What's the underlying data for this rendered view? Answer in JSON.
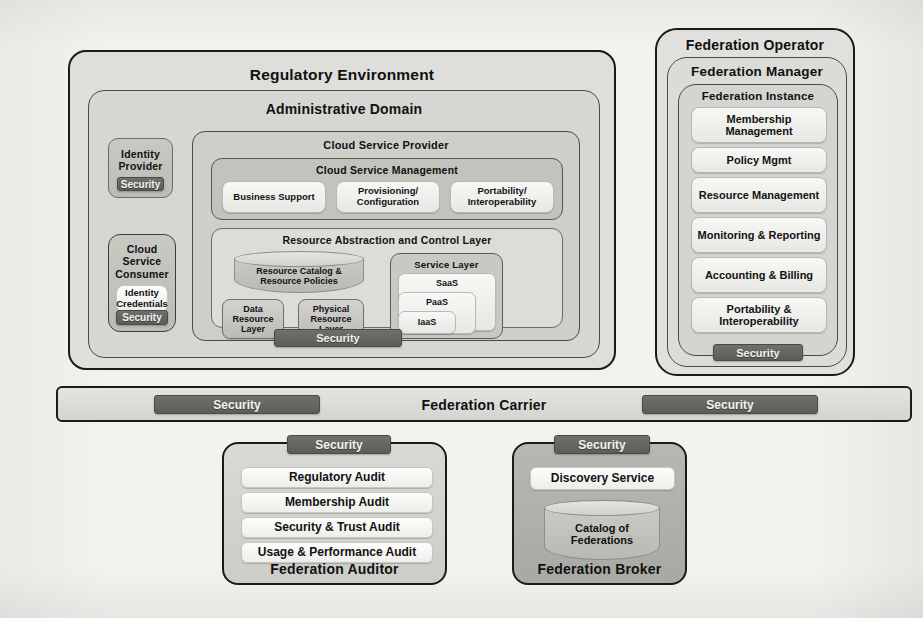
{
  "diagram": {
    "security_label": "Security",
    "colors": {
      "page_bg": "#f3f2ef",
      "outline": "#1a1a1a",
      "security_bar": "#5f5f5b",
      "security_text": "#f2f2ef",
      "chip_light": "#eeeeeb",
      "chip_mid": "#c6c6c1",
      "broker_fill": "#b3b3ae"
    }
  },
  "regulatory_environment": {
    "label": "Regulatory Environment",
    "administrative_domain": {
      "label": "Administrative Domain",
      "security_label": "Security",
      "identity_provider": {
        "label": "Identity Provider",
        "security_label": "Security"
      },
      "cloud_service_consumer": {
        "label": "Cloud Service Consumer",
        "identity_credentials": "Identity Credentials",
        "security_label": "Security"
      },
      "cloud_service_provider": {
        "label": "Cloud Service Provider",
        "cloud_service_management": {
          "label": "Cloud Service Management",
          "items": [
            "Business Support",
            "Provisioning/ Configuration",
            "Portability/ Interoperability"
          ]
        },
        "resource_abstraction_and_control_layer": {
          "label": "Resource Abstraction and Control Layer",
          "resource_catalog": "Resource Catalog & Resource Policies",
          "data_resource_layer": "Data Resource Layer",
          "physical_resource_layer": "Physical Resource Layer",
          "service_layer": {
            "label": "Service Layer",
            "tiers": [
              "SaaS",
              "PaaS",
              "IaaS"
            ]
          }
        }
      }
    }
  },
  "federation_operator": {
    "label": "Federation Operator",
    "security_label": "Security",
    "federation_manager": {
      "label": "Federation Manager",
      "federation_instance": {
        "label": "Federation Instance",
        "items": [
          "Membership Management",
          "Policy Mgmt",
          "Resource Management",
          "Monitoring & Reporting",
          "Accounting & Billing",
          "Portability & Interoperability"
        ]
      }
    }
  },
  "federation_carrier": {
    "label": "Federation Carrier",
    "security_left": "Security",
    "security_right": "Security"
  },
  "federation_auditor": {
    "label": "Federation Auditor",
    "security_label": "Security",
    "items": [
      "Regulatory Audit",
      "Membership Audit",
      "Security & Trust Audit",
      "Usage & Performance Audit"
    ]
  },
  "federation_broker": {
    "label": "Federation Broker",
    "security_label": "Security",
    "discovery_service": "Discovery Service",
    "catalog_of_federations": "Catalog of Federations"
  }
}
